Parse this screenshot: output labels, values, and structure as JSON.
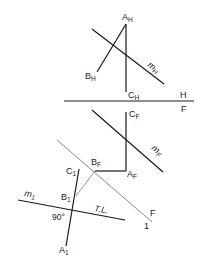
{
  "diagram": {
    "colors": {
      "line": "#1a1a1a",
      "construction": "#8a8a8a",
      "background": "#ffffff"
    },
    "horizontal_view": {
      "point_a": "A",
      "point_a_sub": "H",
      "point_b": "B",
      "point_b_sub": "H",
      "point_c": "C",
      "point_c_sub": "H",
      "line_m": "m",
      "line_m_sub": "H"
    },
    "fold_line_hf": {
      "upper": "H",
      "lower": "F"
    },
    "frontal_view": {
      "point_a": "A",
      "point_a_sub": "F",
      "point_b": "B",
      "point_b_sub": "F",
      "point_c": "C",
      "point_c_sub": "F",
      "line_m": "m",
      "line_m_sub": "F"
    },
    "fold_line_f1": {
      "upper": "F",
      "lower": "1"
    },
    "auxiliary_view": {
      "point_a": "A",
      "point_a_sub": "1",
      "point_b": "B",
      "point_b_sub": "1",
      "point_c": "C",
      "point_c_sub": "1",
      "line_m": "m",
      "line_m_sub": "1",
      "true_length": "T.L.",
      "angle": "90°"
    }
  }
}
